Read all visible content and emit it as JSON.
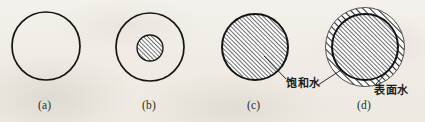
{
  "figure": {
    "background_color": "#f1eee8",
    "ink_color": "#1a1a1a",
    "hatch_fill_color": "#8e8e8e",
    "panels": [
      {
        "id": "a",
        "caption": "(a)",
        "description": "empty-circle",
        "outer_circle": {
          "cx": 46,
          "cy": 46,
          "r": 34,
          "filled": false
        },
        "inner_circle": null,
        "outer_ring": null
      },
      {
        "id": "b",
        "caption": "(b)",
        "description": "circle-with-small-hatched-core",
        "outer_circle": {
          "cx": 150,
          "cy": 47,
          "r": 34,
          "filled": false
        },
        "inner_circle": {
          "cx": 150,
          "cy": 48,
          "r": 13,
          "filled": true
        },
        "outer_ring": null
      },
      {
        "id": "c",
        "caption": "(c)",
        "description": "fully-hatched-circle",
        "outer_circle": {
          "cx": 255,
          "cy": 47,
          "r": 33,
          "filled": true
        },
        "inner_circle": null,
        "outer_ring": null
      },
      {
        "id": "d",
        "caption": "(d)",
        "description": "hatched-circle-with-hatched-surface-ring",
        "outer_circle": {
          "cx": 365,
          "cy": 47,
          "r": 33,
          "filled": true
        },
        "inner_circle": null,
        "outer_ring": {
          "cx": 365,
          "cy": 47,
          "r": 39,
          "thickness": 6
        }
      }
    ],
    "captions": [
      {
        "text": "(a)",
        "x": 38,
        "y": 100
      },
      {
        "text": "(b)",
        "x": 142,
        "y": 100
      },
      {
        "text": "(c)",
        "x": 247,
        "y": 100
      },
      {
        "text": "(d)",
        "x": 357,
        "y": 100
      }
    ],
    "annotations": [
      {
        "name": "saturated-water",
        "text": "饱和水",
        "label_x": 288,
        "label_y": 74,
        "leader": {
          "x1": 264,
          "y1": 56,
          "x2": 286,
          "y2": 79
        }
      },
      {
        "name": "surface-water",
        "text": "表面水",
        "label_x": 376,
        "label_y": 80,
        "leader": {
          "x1": 388,
          "y1": 70,
          "x2": 375,
          "y2": 84
        }
      },
      {
        "name": "saturated-water-pointer-d",
        "text": "",
        "label_x": 0,
        "label_y": 0,
        "leader": {
          "x1": 340,
          "y1": 70,
          "x2": 318,
          "y2": 84
        }
      }
    ]
  }
}
